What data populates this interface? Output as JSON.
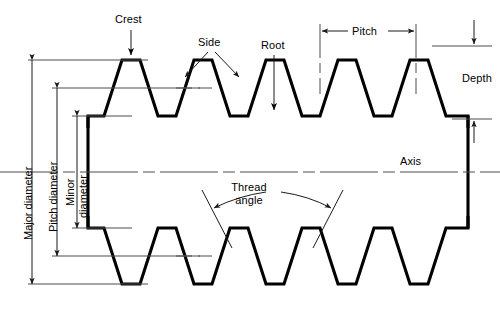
{
  "diagram": {
    "type": "technical-line-drawing",
    "colors": {
      "profile": "#000000",
      "dimension_line": "#4d4d4d",
      "background": "#ffffff",
      "text": "#000000"
    },
    "labels": {
      "crest": "Crest",
      "side": "Side",
      "root": "Root",
      "pitch": "Pitch",
      "depth": "Depth",
      "axis": "Axis",
      "thread_angle_line1": "Thread",
      "thread_angle_line2": "angle",
      "major_diameter": "Major diameter",
      "pitch_diameter": "Pitch diameter",
      "minor_diameter_line1": "Minor",
      "minor_diameter_line2": "diameter"
    },
    "features": [
      "crest",
      "side",
      "root",
      "pitch",
      "depth",
      "axis",
      "thread-angle",
      "major-diameter",
      "pitch-diameter",
      "minor-diameter"
    ]
  }
}
